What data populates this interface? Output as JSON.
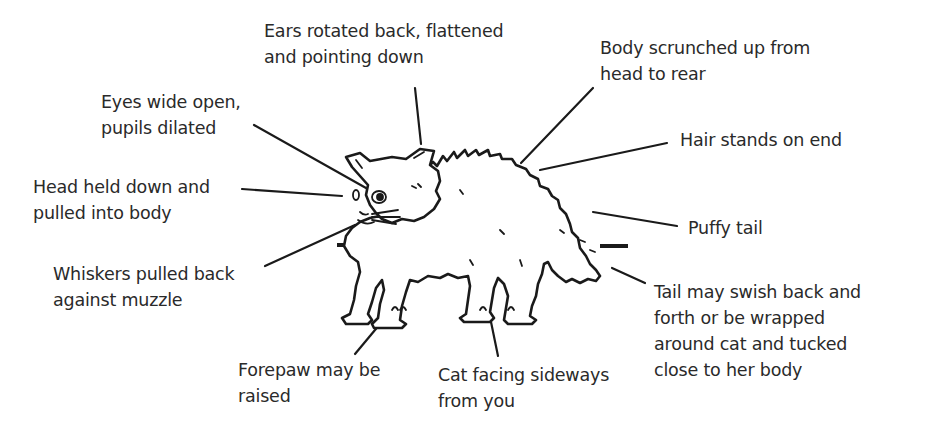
{
  "diagram": {
    "labels": [
      {
        "id": "ears",
        "lines": [
          "Ears rotated back, flattened",
          "and pointing down"
        ]
      },
      {
        "id": "body",
        "lines": [
          "Body scrunched up from",
          "head to rear"
        ]
      },
      {
        "id": "eyes",
        "lines": [
          "Eyes wide open,",
          "pupils dilated"
        ]
      },
      {
        "id": "hair",
        "lines": [
          "Hair stands on end"
        ]
      },
      {
        "id": "head",
        "lines": [
          "Head held down and",
          "pulled into body"
        ]
      },
      {
        "id": "tail-puffy",
        "lines": [
          "Puffy tail"
        ]
      },
      {
        "id": "whiskers",
        "lines": [
          "Whiskers pulled back",
          "against muzzle"
        ]
      },
      {
        "id": "tail-swish",
        "lines": [
          "Tail may swish back and",
          "forth or be wrapped",
          "around cat and tucked",
          "close to her body"
        ]
      },
      {
        "id": "forepaw",
        "lines": [
          "Forepaw may be",
          "raised"
        ]
      },
      {
        "id": "sideways",
        "lines": [
          "Cat facing sideways",
          "from you"
        ]
      }
    ]
  }
}
